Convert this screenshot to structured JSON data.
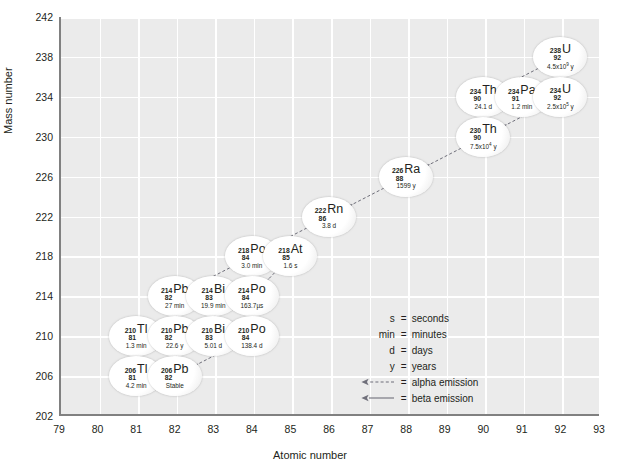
{
  "chart_data": {
    "type": "scatter",
    "title": "",
    "xlabel": "Atomic number",
    "ylabel": "Mass number",
    "xlim": [
      79,
      93
    ],
    "ylim": [
      202,
      242
    ],
    "xticks": [
      79,
      80,
      81,
      82,
      83,
      84,
      85,
      86,
      87,
      88,
      89,
      90,
      91,
      92,
      93
    ],
    "yticks": [
      202,
      206,
      210,
      214,
      218,
      222,
      226,
      230,
      234,
      238,
      242
    ],
    "grid": true,
    "legend_position": "inside-right",
    "nuclides": [
      {
        "symbol": "U",
        "mass": 238,
        "z": 92,
        "half_life": "4.5x10",
        "half_life_exp": "9",
        "half_life_unit": "y",
        "x": 92,
        "y": 238
      },
      {
        "symbol": "Th",
        "mass": 234,
        "z": 90,
        "half_life": "24.1 d",
        "half_life_exp": "",
        "half_life_unit": "",
        "x": 90,
        "y": 234
      },
      {
        "symbol": "Pa",
        "mass": 234,
        "z": 91,
        "half_life": "1.2 min",
        "half_life_exp": "",
        "half_life_unit": "",
        "x": 91,
        "y": 234
      },
      {
        "symbol": "U",
        "mass": 234,
        "z": 92,
        "half_life": "2.5x10",
        "half_life_exp": "5",
        "half_life_unit": "y",
        "x": 92,
        "y": 234
      },
      {
        "symbol": "Th",
        "mass": 230,
        "z": 90,
        "half_life": "7.5x10",
        "half_life_exp": "4",
        "half_life_unit": "y",
        "x": 90,
        "y": 230
      },
      {
        "symbol": "Ra",
        "mass": 226,
        "z": 88,
        "half_life": "1599 y",
        "half_life_exp": "",
        "half_life_unit": "",
        "x": 88,
        "y": 226
      },
      {
        "symbol": "Rn",
        "mass": 222,
        "z": 86,
        "half_life": "3.8 d",
        "half_life_exp": "",
        "half_life_unit": "",
        "x": 86,
        "y": 222
      },
      {
        "symbol": "Po",
        "mass": 218,
        "z": 84,
        "half_life": "3.0 min",
        "half_life_exp": "",
        "half_life_unit": "",
        "x": 84,
        "y": 218
      },
      {
        "symbol": "At",
        "mass": 218,
        "z": 85,
        "half_life": "1.6 s",
        "half_life_exp": "",
        "half_life_unit": "",
        "x": 85,
        "y": 218
      },
      {
        "symbol": "Pb",
        "mass": 214,
        "z": 82,
        "half_life": "27 min",
        "half_life_exp": "",
        "half_life_unit": "",
        "x": 82,
        "y": 214
      },
      {
        "symbol": "Bi",
        "mass": 214,
        "z": 83,
        "half_life": "19.9 min",
        "half_life_exp": "",
        "half_life_unit": "",
        "x": 83,
        "y": 214
      },
      {
        "symbol": "Po",
        "mass": 214,
        "z": 84,
        "half_life": "163.7µs",
        "half_life_exp": "",
        "half_life_unit": "",
        "x": 84,
        "y": 214
      },
      {
        "symbol": "Tl",
        "mass": 210,
        "z": 81,
        "half_life": "1.3 min",
        "half_life_exp": "",
        "half_life_unit": "",
        "x": 81,
        "y": 210
      },
      {
        "symbol": "Pb",
        "mass": 210,
        "z": 82,
        "half_life": "22.6 y",
        "half_life_exp": "",
        "half_life_unit": "",
        "x": 82,
        "y": 210
      },
      {
        "symbol": "Bi",
        "mass": 210,
        "z": 83,
        "half_life": "5.01 d",
        "half_life_exp": "",
        "half_life_unit": "",
        "x": 83,
        "y": 210
      },
      {
        "symbol": "Po",
        "mass": 210,
        "z": 84,
        "half_life": "138.4 d",
        "half_life_exp": "",
        "half_life_unit": "",
        "x": 84,
        "y": 210
      },
      {
        "symbol": "Tl",
        "mass": 206,
        "z": 81,
        "half_life": "4.2 min",
        "half_life_exp": "",
        "half_life_unit": "",
        "x": 81,
        "y": 206
      },
      {
        "symbol": "Pb",
        "mass": 206,
        "z": 82,
        "half_life": "Stable",
        "half_life_exp": "",
        "half_life_unit": "",
        "x": 82,
        "y": 206
      }
    ],
    "decays": [
      {
        "from": [
          92,
          238
        ],
        "to": [
          90,
          234
        ],
        "type": "alpha"
      },
      {
        "from": [
          90,
          234
        ],
        "to": [
          91,
          234
        ],
        "type": "beta"
      },
      {
        "from": [
          91,
          234
        ],
        "to": [
          92,
          234
        ],
        "type": "beta"
      },
      {
        "from": [
          92,
          234
        ],
        "to": [
          90,
          230
        ],
        "type": "alpha"
      },
      {
        "from": [
          90,
          230
        ],
        "to": [
          88,
          226
        ],
        "type": "alpha"
      },
      {
        "from": [
          88,
          226
        ],
        "to": [
          86,
          222
        ],
        "type": "alpha"
      },
      {
        "from": [
          86,
          222
        ],
        "to": [
          84,
          218
        ],
        "type": "alpha"
      },
      {
        "from": [
          84,
          218
        ],
        "to": [
          85,
          218
        ],
        "type": "beta"
      },
      {
        "from": [
          84,
          218
        ],
        "to": [
          82,
          214
        ],
        "type": "alpha"
      },
      {
        "from": [
          85,
          218
        ],
        "to": [
          84,
          214
        ],
        "type": "alpha"
      },
      {
        "from": [
          82,
          214
        ],
        "to": [
          83,
          214
        ],
        "type": "beta"
      },
      {
        "from": [
          83,
          214
        ],
        "to": [
          84,
          214
        ],
        "type": "beta"
      },
      {
        "from": [
          83,
          214
        ],
        "to": [
          81,
          210
        ],
        "type": "alpha"
      },
      {
        "from": [
          84,
          214
        ],
        "to": [
          82,
          210
        ],
        "type": "alpha"
      },
      {
        "from": [
          81,
          210
        ],
        "to": [
          82,
          210
        ],
        "type": "beta"
      },
      {
        "from": [
          82,
          210
        ],
        "to": [
          83,
          210
        ],
        "type": "beta"
      },
      {
        "from": [
          83,
          210
        ],
        "to": [
          84,
          210
        ],
        "type": "beta"
      },
      {
        "from": [
          83,
          210
        ],
        "to": [
          81,
          206
        ],
        "type": "alpha"
      },
      {
        "from": [
          84,
          210
        ],
        "to": [
          82,
          206
        ],
        "type": "alpha"
      },
      {
        "from": [
          81,
          206
        ],
        "to": [
          82,
          206
        ],
        "type": "beta"
      }
    ],
    "legend": [
      {
        "key": "s",
        "eq": "=",
        "value": "seconds",
        "kind": "text"
      },
      {
        "key": "min",
        "eq": "=",
        "value": "minutes",
        "kind": "text"
      },
      {
        "key": "d",
        "eq": "=",
        "value": "days",
        "kind": "text"
      },
      {
        "key": "y",
        "eq": "=",
        "value": "years",
        "kind": "text"
      },
      {
        "key": "",
        "eq": "=",
        "value": "alpha emission",
        "kind": "alpha-arrow"
      },
      {
        "key": "",
        "eq": "=",
        "value": "beta emission",
        "kind": "beta-arrow"
      }
    ]
  },
  "colors": {
    "plot_background": "#ebebeb",
    "gridline": "#ffffff",
    "axis": "#808080",
    "text": "#231f20",
    "arrow": "#6f6f7a"
  }
}
